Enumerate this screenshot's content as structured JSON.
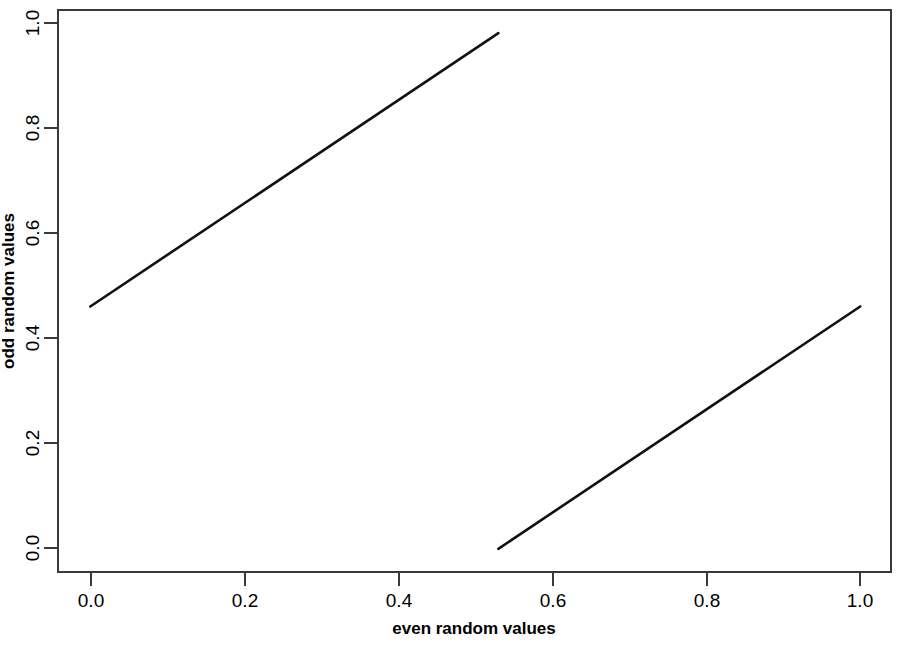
{
  "chart_data": {
    "type": "line",
    "title": "",
    "subtitle": "",
    "xlabel": "even random values",
    "ylabel": "odd random values",
    "xlim": [
      -0.042,
      1.04
    ],
    "ylim": [
      -0.045,
      1.045
    ],
    "grid": false,
    "legend": null,
    "xticks": [
      0.0,
      0.2,
      0.4,
      0.6,
      0.8,
      1.0
    ],
    "xticklabels": [
      "0.0",
      "0.2",
      "0.4",
      "0.6",
      "0.8",
      "1.0"
    ],
    "yticks": [
      0.0,
      0.2,
      0.4,
      0.6,
      0.8,
      1.0
    ],
    "yticklabels": [
      "0.0",
      "0.2",
      "0.4",
      "0.6",
      "0.8",
      "1.0"
    ],
    "series": [
      {
        "name": "upper-segment",
        "color": "#111111",
        "linewidth": 2.6,
        "x": [
          0.0,
          0.53
        ],
        "y": [
          0.47,
          1.0
        ]
      },
      {
        "name": "lower-segment",
        "color": "#111111",
        "linewidth": 2.6,
        "x": [
          0.53,
          1.0
        ],
        "y": [
          0.0,
          0.47
        ]
      }
    ],
    "annotations": []
  },
  "axes": {
    "x_title": "even random values",
    "y_title": "odd random values"
  },
  "colors": {
    "background": "#ffffff",
    "frame": "#3a3a3a",
    "data": "#111111",
    "text": "#000000"
  }
}
